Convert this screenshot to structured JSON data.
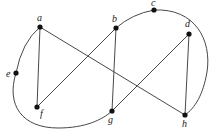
{
  "diagram": {
    "type": "graph",
    "colors": {
      "edge": "#333333",
      "node": "#111111",
      "label": "#222222",
      "background": "#ffffff"
    },
    "nodes": [
      {
        "id": "a",
        "label": "a",
        "x": 40,
        "y": 27
      },
      {
        "id": "b",
        "label": "b",
        "x": 116,
        "y": 28
      },
      {
        "id": "c",
        "label": "c",
        "x": 154,
        "y": 10
      },
      {
        "id": "d",
        "label": "d",
        "x": 189,
        "y": 34
      },
      {
        "id": "e",
        "label": "e",
        "x": 16,
        "y": 73
      },
      {
        "id": "f",
        "label": "f",
        "x": 37,
        "y": 107
      },
      {
        "id": "g",
        "label": "g",
        "x": 112,
        "y": 111
      },
      {
        "id": "h",
        "label": "h",
        "x": 185,
        "y": 115
      }
    ],
    "straight_edges": [
      [
        "a",
        "f"
      ],
      [
        "a",
        "h"
      ],
      [
        "b",
        "f"
      ],
      [
        "b",
        "g"
      ],
      [
        "d",
        "g"
      ],
      [
        "d",
        "h"
      ]
    ],
    "curved_edges": [
      [
        "a",
        "e"
      ],
      [
        "e",
        "g"
      ],
      [
        "b",
        "c"
      ],
      [
        "c",
        "h"
      ]
    ]
  }
}
